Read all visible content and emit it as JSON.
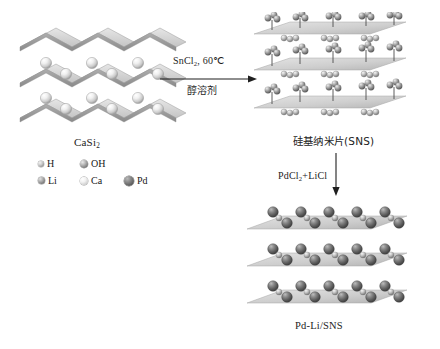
{
  "diagram": {
    "type": "chemical-reaction-scheme"
  },
  "structures": {
    "reactant": {
      "label_main": "CaSi",
      "label_sub": "2",
      "description": "Layered CaSi2 with corrugated silicon sheets and interlayer Ca atoms",
      "layers": 3,
      "sphere_type": "Ca"
    },
    "intermediate": {
      "label": "硅基纳米片(SNS)",
      "description": "Silicon nanosheets terminated with OH groups above and H below",
      "layers": 3,
      "sphere_types": [
        "OH",
        "H"
      ]
    },
    "product": {
      "label": "Pd-Li/SNS",
      "description": "Pd nanoparticles decorated lithium-intercalated silicon nanosheets",
      "layers": 3,
      "sphere_type": "Pd"
    }
  },
  "reactions": {
    "step1": {
      "reagent_main": "SnCl",
      "reagent_sub": "2",
      "reagent_tail": ", 60℃",
      "condition": "醇溶剂",
      "direction": "right"
    },
    "step2": {
      "reagent_main": "PdCl",
      "reagent_sub": "2",
      "reagent_tail": "+LiCl",
      "direction": "down"
    }
  },
  "legend": {
    "rows": [
      [
        {
          "symbol": "H",
          "kind": "h",
          "size": 6
        },
        {
          "symbol": "OH",
          "kind": "oh",
          "size": 8
        }
      ],
      [
        {
          "symbol": "Li",
          "kind": "li",
          "size": 7
        },
        {
          "symbol": "Ca",
          "kind": "ca",
          "size": 8
        },
        {
          "symbol": "Pd",
          "kind": "pd",
          "size": 10
        }
      ]
    ]
  },
  "colors": {
    "sheet_top": "#d9d9d9",
    "sheet_shade": "#9e9e9e",
    "h": "#a8a8a8",
    "oh": "#8f8f8f",
    "li": "#8a8a8a",
    "ca": "#ededed",
    "pd": "#5a5a5a",
    "text": "#1d1d1d"
  }
}
